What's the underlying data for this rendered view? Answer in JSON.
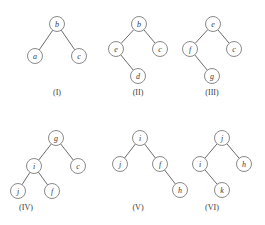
{
  "figure": {
    "background_color": "#ffffff",
    "node_fill": "#ffffff",
    "node_stroke": "#8a8a8a",
    "edge_stroke": "#6b6b6b",
    "label_color": "#3a3a3a",
    "node_radius": 7.5
  },
  "trees": [
    {
      "id": "tree-1",
      "caption": "(I)",
      "caption_x": 57,
      "caption_y": 88,
      "origin_x": 18,
      "origin_y": 14,
      "width": 78,
      "height": 66,
      "root": "b",
      "nodes": [
        {
          "label": "b",
          "x": 39,
          "y": 10
        },
        {
          "label": "a",
          "x": 17,
          "y": 42
        },
        {
          "label": "c",
          "x": 61,
          "y": 42
        }
      ],
      "edges": [
        {
          "from": "b",
          "to": "a",
          "x1": 39,
          "y1": 10,
          "x2": 17,
          "y2": 42
        },
        {
          "from": "b",
          "to": "c",
          "x1": 39,
          "y1": 10,
          "x2": 61,
          "y2": 42
        }
      ]
    },
    {
      "id": "tree-2",
      "caption": "(II)",
      "caption_x": 138,
      "caption_y": 88,
      "origin_x": 98,
      "origin_y": 14,
      "width": 80,
      "height": 66,
      "root": "b",
      "nodes": [
        {
          "label": "b",
          "x": 41,
          "y": 10
        },
        {
          "label": "e",
          "x": 18,
          "y": 35
        },
        {
          "label": "c",
          "x": 62,
          "y": 35
        },
        {
          "label": "d",
          "x": 40,
          "y": 62
        }
      ],
      "edges": [
        {
          "from": "b",
          "to": "e",
          "x1": 41,
          "y1": 10,
          "x2": 18,
          "y2": 35
        },
        {
          "from": "b",
          "to": "c",
          "x1": 41,
          "y1": 10,
          "x2": 62,
          "y2": 35
        },
        {
          "from": "e",
          "to": "d",
          "x1": 18,
          "y1": 35,
          "x2": 40,
          "y2": 62
        }
      ]
    },
    {
      "id": "tree-3",
      "caption": "(III)",
      "caption_x": 212,
      "caption_y": 88,
      "origin_x": 172,
      "origin_y": 14,
      "width": 80,
      "height": 66,
      "root": "e",
      "nodes": [
        {
          "label": "e",
          "x": 41,
          "y": 10
        },
        {
          "label": "f",
          "x": 18,
          "y": 35
        },
        {
          "label": "c",
          "x": 62,
          "y": 35
        },
        {
          "label": "g",
          "x": 40,
          "y": 62
        }
      ],
      "edges": [
        {
          "from": "e",
          "to": "f",
          "x1": 41,
          "y1": 10,
          "x2": 18,
          "y2": 35
        },
        {
          "from": "e",
          "to": "c",
          "x1": 41,
          "y1": 10,
          "x2": 62,
          "y2": 35
        },
        {
          "from": "f",
          "to": "g",
          "x1": 18,
          "y1": 35,
          "x2": 40,
          "y2": 62
        }
      ]
    },
    {
      "id": "tree-4",
      "caption": "(IV)",
      "caption_x": 26,
      "caption_y": 203,
      "origin_x": 8,
      "origin_y": 128,
      "width": 84,
      "height": 70,
      "root": "g",
      "nodes": [
        {
          "label": "g",
          "x": 48,
          "y": 10
        },
        {
          "label": "i",
          "x": 26,
          "y": 38
        },
        {
          "label": "c",
          "x": 70,
          "y": 38
        },
        {
          "label": "j",
          "x": 10,
          "y": 63
        },
        {
          "label": "f",
          "x": 44,
          "y": 63
        }
      ],
      "edges": [
        {
          "from": "g",
          "to": "i",
          "x1": 48,
          "y1": 10,
          "x2": 26,
          "y2": 38
        },
        {
          "from": "g",
          "to": "c",
          "x1": 48,
          "y1": 10,
          "x2": 70,
          "y2": 38
        },
        {
          "from": "i",
          "to": "j",
          "x1": 26,
          "y1": 38,
          "x2": 10,
          "y2": 63
        },
        {
          "from": "i",
          "to": "f",
          "x1": 26,
          "y1": 38,
          "x2": 44,
          "y2": 63
        }
      ]
    },
    {
      "id": "tree-5",
      "caption": "(V)",
      "caption_x": 138,
      "caption_y": 203,
      "origin_x": 110,
      "origin_y": 128,
      "width": 80,
      "height": 70,
      "root": "i",
      "nodes": [
        {
          "label": "i",
          "x": 30,
          "y": 10
        },
        {
          "label": "j",
          "x": 10,
          "y": 36
        },
        {
          "label": "f",
          "x": 50,
          "y": 36
        },
        {
          "label": "h",
          "x": 70,
          "y": 62
        }
      ],
      "edges": [
        {
          "from": "i",
          "to": "j",
          "x1": 30,
          "y1": 10,
          "x2": 10,
          "y2": 36
        },
        {
          "from": "i",
          "to": "f",
          "x1": 30,
          "y1": 10,
          "x2": 50,
          "y2": 36
        },
        {
          "from": "f",
          "to": "h",
          "x1": 50,
          "y1": 36,
          "x2": 70,
          "y2": 62
        }
      ]
    },
    {
      "id": "tree-6",
      "caption": "(VI)",
      "caption_x": 212,
      "caption_y": 203,
      "origin_x": 186,
      "origin_y": 128,
      "width": 76,
      "height": 70,
      "root": "j",
      "nodes": [
        {
          "label": "j",
          "x": 36,
          "y": 10
        },
        {
          "label": "i",
          "x": 14,
          "y": 36
        },
        {
          "label": "h",
          "x": 58,
          "y": 36
        },
        {
          "label": "k",
          "x": 36,
          "y": 62
        }
      ],
      "edges": [
        {
          "from": "j",
          "to": "i",
          "x1": 36,
          "y1": 10,
          "x2": 14,
          "y2": 36
        },
        {
          "from": "j",
          "to": "h",
          "x1": 36,
          "y1": 10,
          "x2": 58,
          "y2": 36
        },
        {
          "from": "i",
          "to": "k",
          "x1": 14,
          "y1": 36,
          "x2": 36,
          "y2": 62
        }
      ]
    }
  ]
}
